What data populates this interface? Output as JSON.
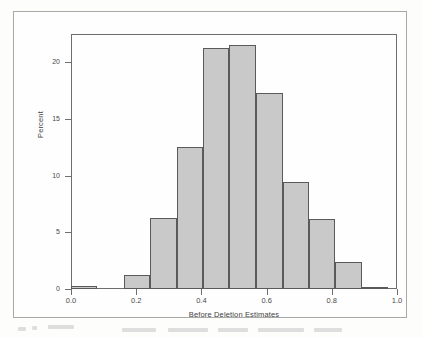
{
  "figure": {
    "background_color": "#fefefe",
    "frame_color": "#a8a8a6",
    "axis_color": "#6e6e6e"
  },
  "chart_data": {
    "type": "bar",
    "title": "",
    "subtitle": "",
    "xlabel": "Before Deletion Estimates",
    "ylabel": "Percent",
    "xlim": [
      0.0,
      1.0
    ],
    "ylim": [
      0,
      22.5
    ],
    "grid": false,
    "legend": null,
    "bar_fill_color": "#c9c9c9",
    "bar_edge_color": "#5a5a5a",
    "bin_width": 0.081,
    "xticks": [
      0.0,
      0.2,
      0.4,
      0.6,
      0.8,
      1.0
    ],
    "xtick_labels": [
      "0.0",
      "0.2",
      "0.4",
      "0.6",
      "0.8",
      "1.0"
    ],
    "yticks": [
      0,
      5,
      10,
      15,
      20
    ],
    "ytick_labels": [
      "0",
      "5",
      "10",
      "15",
      "20"
    ],
    "bins": [
      {
        "x0": 0.0,
        "x1": 0.081,
        "center": 0.041,
        "percent": 0.3
      },
      {
        "x0": 0.162,
        "x1": 0.243,
        "center": 0.203,
        "percent": 1.2
      },
      {
        "x0": 0.243,
        "x1": 0.324,
        "center": 0.284,
        "percent": 6.3
      },
      {
        "x0": 0.324,
        "x1": 0.405,
        "center": 0.365,
        "percent": 12.5
      },
      {
        "x0": 0.405,
        "x1": 0.486,
        "center": 0.446,
        "percent": 21.3
      },
      {
        "x0": 0.486,
        "x1": 0.568,
        "center": 0.527,
        "percent": 21.5
      },
      {
        "x0": 0.568,
        "x1": 0.649,
        "center": 0.608,
        "percent": 17.3
      },
      {
        "x0": 0.649,
        "x1": 0.73,
        "center": 0.689,
        "percent": 9.4
      },
      {
        "x0": 0.73,
        "x1": 0.811,
        "center": 0.77,
        "percent": 6.2
      },
      {
        "x0": 0.811,
        "x1": 0.892,
        "center": 0.851,
        "percent": 2.4
      },
      {
        "x0": 0.892,
        "x1": 0.973,
        "center": 0.932,
        "percent": 0.2
      }
    ],
    "categories": [
      "0.04",
      "0.20",
      "0.28",
      "0.37",
      "0.45",
      "0.53",
      "0.61",
      "0.69",
      "0.77",
      "0.85",
      "0.93"
    ],
    "values": [
      0.3,
      1.2,
      6.3,
      12.5,
      21.3,
      21.5,
      17.3,
      9.4,
      6.2,
      2.4,
      0.2
    ]
  }
}
